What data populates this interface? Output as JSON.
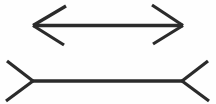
{
  "figure": {
    "name": "Müller-Lyer illusion",
    "type": "line-illusion-diagram",
    "background_color": "#fefefe",
    "stroke_color": "#2b2b2b",
    "canvas": {
      "width": 216,
      "height": 104
    },
    "shaft_stroke_width": 3.4,
    "fin_stroke_width": 3.2,
    "figures": [
      {
        "id": "top-figure",
        "label": "arrowheads-outward",
        "arrow_style": "outward-tips",
        "shaft": {
          "x1": 33,
          "y1": 25.5,
          "x2": 183,
          "y2": 25.5,
          "length": 150
        },
        "fins": [
          {
            "id": "top-left-upper-fin",
            "x1": 33,
            "y1": 25.5,
            "x2": 66,
            "y2": 6
          },
          {
            "id": "top-left-lower-fin",
            "x1": 33,
            "y1": 25.5,
            "x2": 64,
            "y2": 45
          },
          {
            "id": "top-right-upper-fin",
            "x1": 183,
            "y1": 25.5,
            "x2": 152,
            "y2": 5
          },
          {
            "id": "top-right-lower-fin",
            "x1": 183,
            "y1": 25.5,
            "x2": 153,
            "y2": 44
          }
        ]
      },
      {
        "id": "bottom-figure",
        "label": "fins-inward",
        "arrow_style": "inward-tails",
        "shaft": {
          "x1": 33,
          "y1": 81,
          "x2": 182,
          "y2": 81,
          "length": 149
        },
        "fins": [
          {
            "id": "bottom-left-upper-fin",
            "x1": 33,
            "y1": 81,
            "x2": 7,
            "y2": 61
          },
          {
            "id": "bottom-left-lower-fin",
            "x1": 33,
            "y1": 81,
            "x2": 6,
            "y2": 101
          },
          {
            "id": "bottom-right-upper-fin",
            "x1": 182,
            "y1": 81,
            "x2": 208,
            "y2": 61
          },
          {
            "id": "bottom-right-lower-fin",
            "x1": 182,
            "y1": 81,
            "x2": 209,
            "y2": 101
          }
        ]
      }
    ]
  }
}
